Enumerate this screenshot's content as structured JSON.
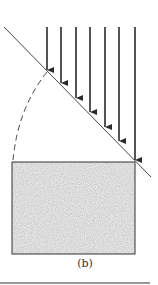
{
  "figure": {
    "label": "(b)",
    "colors": {
      "stroke": "#333333",
      "arrow": "#2a2a2a",
      "fill_speckle_light": "#eeeeee",
      "fill_speckle_dark": "#9a9a9a",
      "rule": "#777777"
    },
    "elements": {
      "incident_arrows": {
        "count": 7,
        "direction": "down"
      },
      "diagonal_surface": "inclined plane at ~45 degrees",
      "dashed_arc": "quarter-circle arc from surface to block",
      "block": "speckled rectangle (material sample)"
    }
  }
}
